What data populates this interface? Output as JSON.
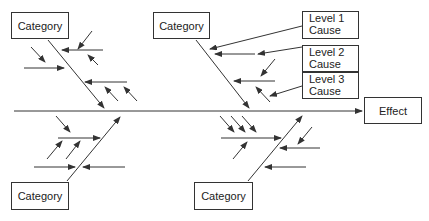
{
  "diagram": {
    "type": "fishbone",
    "effect": {
      "label": "Effect"
    },
    "categories": [
      {
        "label": "Category",
        "position": "top-left"
      },
      {
        "label": "Category",
        "position": "top-middle"
      },
      {
        "label": "Category",
        "position": "bottom-left"
      },
      {
        "label": "Category",
        "position": "bottom-middle"
      }
    ],
    "legend": [
      {
        "line1": "Level 1",
        "line2": "Cause"
      },
      {
        "line1": "Level 2",
        "line2": "Cause"
      },
      {
        "line1": "Level 3",
        "line2": "Cause"
      }
    ],
    "colors": {
      "line": "#333333",
      "text": "#222222",
      "background": "#ffffff"
    }
  }
}
